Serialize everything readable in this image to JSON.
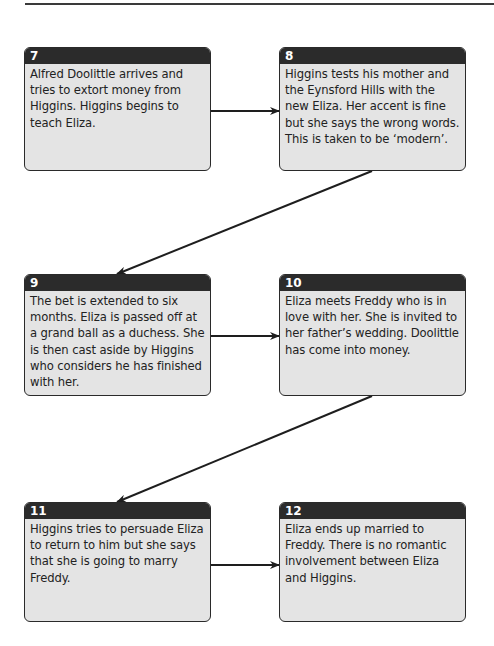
{
  "diagram": {
    "type": "flowchart",
    "steps": [
      {
        "number": "7",
        "text": "Alfred Doolittle arrives and tries to extort money from Higgins. Higgins begins to teach Eliza."
      },
      {
        "number": "8",
        "text": "Higgins tests his mother and the Eynsford Hills with the new Eliza. Her accent is fine but she says the wrong words. This is taken to be ‘modern’."
      },
      {
        "number": "9",
        "text": "The bet is extended to six months. Eliza is passed off at a grand ball as a duchess. She is then cast aside by Higgins who considers he has finished with her."
      },
      {
        "number": "10",
        "text": "Eliza meets Freddy who is in love with her. She is invited to her father’s wedding. Doolittle has come into money."
      },
      {
        "number": "11",
        "text": "Higgins tries to persuade Eliza to return to him but she says that she is going to marry Freddy."
      },
      {
        "number": "12",
        "text": "Eliza ends up married to Freddy. There is no romantic involvement between Eliza and Higgins."
      }
    ],
    "connections": [
      {
        "from": "7",
        "to": "8"
      },
      {
        "from": "8",
        "to": "9"
      },
      {
        "from": "9",
        "to": "10"
      },
      {
        "from": "10",
        "to": "11"
      },
      {
        "from": "11",
        "to": "12"
      }
    ],
    "colors": {
      "header": "#2b2b2b",
      "box_fill": "#e4e4e4",
      "border": "#2a2a2a",
      "text": "#222222"
    }
  }
}
